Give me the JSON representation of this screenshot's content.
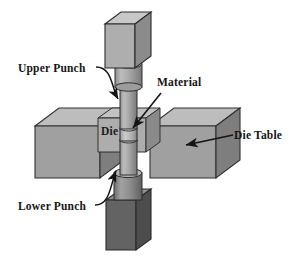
{
  "figure": {
    "type": "isometric-technical-illustration",
    "background_color": "#ffffff",
    "render_style": "grayscale shaded 3D line drawing"
  },
  "labels": {
    "upper_punch": "Upper Punch",
    "lower_punch": "Lower Punch",
    "material": "Material",
    "die_table": "Die Table",
    "die": "Die"
  },
  "leaders": [
    {
      "name": "upper-punch-leader",
      "label": "Upper Punch",
      "style": "curved",
      "from": [
        96,
        68
      ],
      "to": [
        129,
        104
      ],
      "arrowhead": true
    },
    {
      "name": "lower-punch-leader",
      "label": "Lower Punch",
      "style": "curved",
      "from": [
        96,
        205
      ],
      "to": [
        121,
        163
      ],
      "arrowhead": true
    },
    {
      "name": "material-leader",
      "label": "Material",
      "style": "straight",
      "from": [
        160,
        93
      ],
      "to": [
        131,
        131
      ],
      "arrowhead": true
    },
    {
      "name": "die-table-leader",
      "label": "Die Table",
      "style": "straight",
      "from": [
        232,
        136
      ],
      "to": [
        187,
        146
      ],
      "arrowhead": true
    }
  ],
  "parts": {
    "upper_punch_head": {
      "name": "upper-punch-head-block",
      "shape": "cube",
      "shade": "light"
    },
    "upper_punch_shaft": {
      "name": "upper-punch-shaft",
      "shape": "stepped-cylinder",
      "shade": "medium"
    },
    "material_slug": {
      "name": "material-slug",
      "shape": "short-cylinder",
      "shade": "light"
    },
    "lower_punch_shaft": {
      "name": "lower-punch-shaft",
      "shape": "stepped-cylinder",
      "shade": "medium"
    },
    "lower_punch_head": {
      "name": "lower-punch-head-block",
      "shape": "cube",
      "shade": "dark"
    },
    "die_block": {
      "name": "die-block",
      "shape": "cuboid",
      "shade": "medium"
    },
    "die_table_left": {
      "name": "die-table-left-block",
      "shape": "cuboid",
      "shade": "medium"
    },
    "die_table_right": {
      "name": "die-table-right-block",
      "shape": "cuboid",
      "shade": "medium"
    }
  },
  "palette": {
    "outline": "#2b2b2b",
    "face_light": "#b9b9b9",
    "face_top": "#c6c6c6",
    "face_medium": "#a3a3a3",
    "face_side": "#8d8d8d",
    "face_dark": "#6d6d6d",
    "face_darkest": "#555555",
    "text": "#151515",
    "background": "#ffffff"
  }
}
